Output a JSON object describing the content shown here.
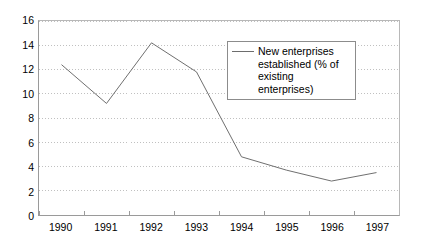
{
  "chart_data": {
    "type": "line",
    "title": "",
    "subtitle": "",
    "xlabel": "",
    "ylabel": "",
    "categories": [
      "1990",
      "1991",
      "1992",
      "1993",
      "1994",
      "1995",
      "1996",
      "1997"
    ],
    "series": [
      {
        "name": "New enterprises established (% of existing enterprises)",
        "values": [
          12.4,
          9.2,
          14.2,
          11.8,
          4.8,
          3.7,
          2.8,
          3.5
        ],
        "color": "#6d6d6d"
      }
    ],
    "ylim": [
      0,
      16
    ],
    "yticks": [
      0,
      2,
      4,
      6,
      8,
      10,
      12,
      14,
      16
    ],
    "ytick_labels": [
      "0",
      "2",
      "4",
      "6",
      "8",
      "10",
      "12",
      "14",
      "16"
    ],
    "grid": "horizontal-dotted",
    "grid_color": "#bfbfbf",
    "legend_position": "inside-top-center",
    "legend_entries": [
      "New enterprises established (% of existing enterprises)"
    ],
    "annotations": []
  },
  "legend": {
    "label": "New enterprises\nestablished (% of\nexisting enterprises)"
  },
  "axes": {
    "axis_color": "#9a9a9a"
  }
}
